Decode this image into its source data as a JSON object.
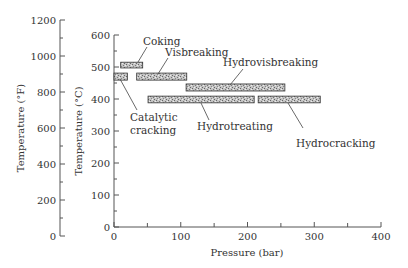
{
  "chart_data": {
    "type": "range-bar",
    "title": "",
    "xlabel": "Pressure (bar)",
    "ylabel": "Temperature (°C)",
    "ylabel_secondary": "Temperature (°F)",
    "xlim": [
      0,
      400
    ],
    "ylim": [
      0,
      600
    ],
    "ylim_secondary": [
      0,
      1200
    ],
    "x_ticks": [
      0,
      100,
      200,
      300,
      400
    ],
    "x_minor_ticks": [
      50,
      150,
      250,
      350
    ],
    "y_ticks": [
      0,
      100,
      200,
      300,
      400,
      500,
      600
    ],
    "y_minor_ticks": [
      50,
      150,
      250,
      350,
      450,
      550
    ],
    "y_secondary_ticks": [
      0,
      200,
      400,
      600,
      800,
      1000,
      1200
    ],
    "y_secondary_minor_ticks": [
      100,
      300,
      500,
      700,
      900,
      1100
    ],
    "grid": false,
    "legend": "none",
    "series": [
      {
        "name": "Coking",
        "p_min": 10,
        "p_max": 43,
        "t_min": 497,
        "t_max": 515
      },
      {
        "name": "Catalytic cracking",
        "p_min": 0,
        "p_max": 20,
        "t_min": 459,
        "t_max": 481
      },
      {
        "name": "Visbreaking",
        "p_min": 34,
        "p_max": 109,
        "t_min": 459,
        "t_max": 481
      },
      {
        "name": "Hydrovisbreaking",
        "p_min": 108,
        "p_max": 256,
        "t_min": 425,
        "t_max": 447
      },
      {
        "name": "Hydrotreating",
        "p_min": 51,
        "p_max": 210,
        "t_min": 388,
        "t_max": 409
      },
      {
        "name": "Hydrocracking",
        "p_min": 216,
        "p_max": 309,
        "t_min": 388,
        "t_max": 409
      }
    ],
    "colors": {
      "bar_fill": "#b8b8b8",
      "bar_stroke": "#333333",
      "axis": "#555555",
      "text": "#333333"
    }
  },
  "labels": {
    "coking": "Coking",
    "visbreaking": "Visbreaking",
    "hydrovisbreaking": "Hydrovisbreaking",
    "catalytic_1": "Catalytic",
    "catalytic_2": "cracking",
    "hydrotreating": "Hydrotreating",
    "hydrocracking": "Hydrocracking"
  }
}
